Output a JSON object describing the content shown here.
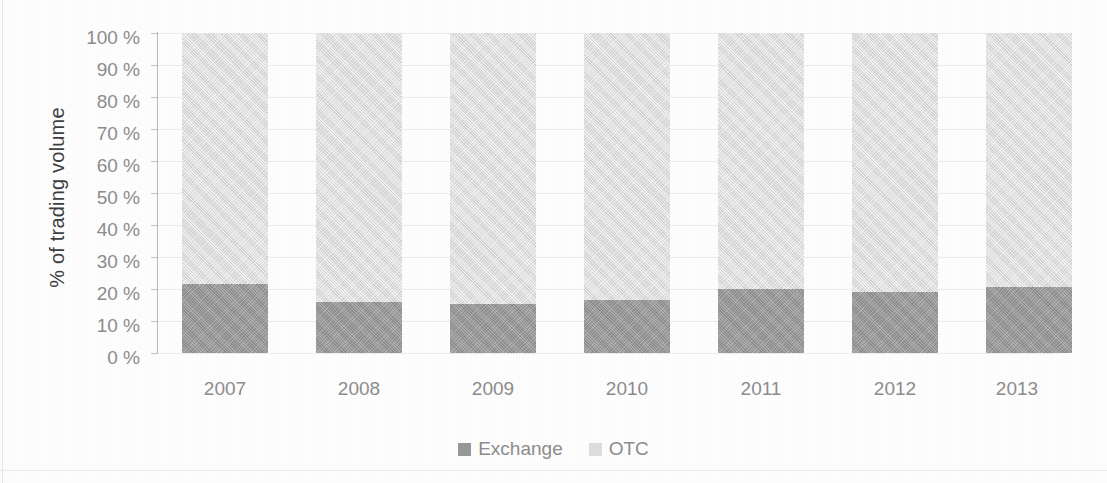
{
  "chart_data": {
    "type": "bar",
    "subtype": "100% stacked column",
    "title": "",
    "xlabel": "",
    "ylabel": "% of trading volume",
    "categories": [
      "2007",
      "2008",
      "2009",
      "2010",
      "2011",
      "2012",
      "2013"
    ],
    "series": [
      {
        "name": "Exchange",
        "color": "#989898",
        "values": [
          21.5,
          16,
          15.3,
          16.5,
          20,
          19,
          20.5
        ]
      },
      {
        "name": "OTC",
        "color": "#dedede",
        "values": [
          78.5,
          84,
          84.7,
          83.5,
          80,
          81,
          79.5
        ]
      }
    ],
    "ylim": [
      0,
      100
    ],
    "y_ticks": [
      "0 %",
      "10 %",
      "20 %",
      "30 %",
      "40 %",
      "50 %",
      "60 %",
      "70 %",
      "80 %",
      "90 %",
      "100 %"
    ],
    "y_tick_values": [
      0,
      10,
      20,
      30,
      40,
      50,
      60,
      70,
      80,
      90,
      100
    ],
    "grid": true,
    "legend_position": "bottom"
  },
  "axes": {
    "y_title": "% of trading volume",
    "y_ticks": [
      {
        "label": "100 %",
        "value": 100
      },
      {
        "label": "90 %",
        "value": 90
      },
      {
        "label": "80 %",
        "value": 80
      },
      {
        "label": "70 %",
        "value": 70
      },
      {
        "label": "60 %",
        "value": 60
      },
      {
        "label": "50 %",
        "value": 50
      },
      {
        "label": "40 %",
        "value": 40
      },
      {
        "label": "30 %",
        "value": 30
      },
      {
        "label": "20 %",
        "value": 20
      },
      {
        "label": "10 %",
        "value": 10
      },
      {
        "label": "0 %",
        "value": 0
      }
    ],
    "x_ticks": [
      {
        "label": "2007"
      },
      {
        "label": "2008"
      },
      {
        "label": "2009"
      },
      {
        "label": "2010"
      },
      {
        "label": "2011"
      },
      {
        "label": "2012"
      },
      {
        "label": "2013"
      }
    ]
  },
  "legend": {
    "items": [
      {
        "label": "Exchange",
        "color": "#989898"
      },
      {
        "label": "OTC",
        "color": "#dedede"
      }
    ]
  }
}
